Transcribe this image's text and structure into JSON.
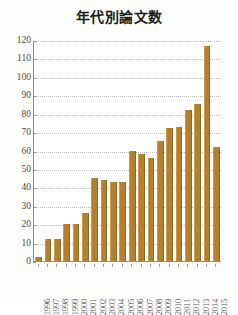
{
  "chart_data": {
    "type": "bar",
    "title": "年代別論文数",
    "xlabel": "",
    "ylabel": "",
    "categories": [
      "1996",
      "1997",
      "1998",
      "1999",
      "2000",
      "2001",
      "2002",
      "2003",
      "2004",
      "2005",
      "2006",
      "2007",
      "2008",
      "2009",
      "2010",
      "2011",
      "2012",
      "2013",
      "2014",
      "2015"
    ],
    "values": [
      2,
      12,
      12,
      20,
      20,
      26,
      45,
      44,
      43,
      43,
      60,
      58,
      56,
      65,
      72,
      73,
      82,
      85,
      117,
      62
    ],
    "ylim": [
      0,
      120
    ],
    "ytick_labels": [
      "0",
      "10",
      "20",
      "30",
      "40",
      "50",
      "60",
      "70",
      "80",
      "90",
      "100",
      "110",
      "120"
    ],
    "ytick_values": [
      0,
      10,
      20,
      30,
      40,
      50,
      60,
      70,
      80,
      90,
      100,
      110,
      120
    ],
    "grid": true,
    "legend": false,
    "bar_color": "#b5802e",
    "grid_color": "#b9b9b9",
    "axis_color": "#8e8e8e",
    "background_color": "#ffffff"
  }
}
